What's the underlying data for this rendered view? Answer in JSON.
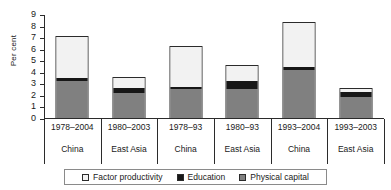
{
  "chart_data": {
    "type": "bar",
    "stacked": true,
    "title": "",
    "xlabel": "",
    "ylabel": "Per cent",
    "ylim": [
      0,
      9
    ],
    "yticks": [
      0,
      1,
      2,
      3,
      4,
      5,
      6,
      7,
      8,
      9
    ],
    "grid": false,
    "legend_position": "bottom",
    "categories": [
      {
        "period": "1978–2004",
        "region": "China"
      },
      {
        "period": "1980–2003",
        "region": "East Asia"
      },
      {
        "period": "1978–93",
        "region": "China"
      },
      {
        "period": "1980–93",
        "region": "East Asia"
      },
      {
        "period": "1993–2004",
        "region": "China"
      },
      {
        "period": "1993–2003",
        "region": "East Asia"
      }
    ],
    "series": [
      {
        "name": "Physical capital",
        "color": "#808080",
        "values": [
          3.3,
          2.25,
          2.6,
          2.65,
          4.25,
          1.95
        ]
      },
      {
        "name": "Education",
        "color": "#171717",
        "values": [
          0.25,
          0.5,
          0.2,
          0.65,
          0.25,
          0.5
        ]
      },
      {
        "name": "Factor productivity",
        "color": "#f2f2f2",
        "values": [
          3.65,
          0.85,
          3.5,
          1.35,
          3.9,
          0.2
        ]
      }
    ],
    "totals": [
      7.2,
      3.6,
      6.3,
      4.65,
      8.4,
      2.65
    ],
    "legend": [
      {
        "label": "Factor productivity",
        "color": "#f2f2f2"
      },
      {
        "label": "Education",
        "color": "#171717"
      },
      {
        "label": "Physical capital",
        "color": "#808080"
      }
    ]
  }
}
